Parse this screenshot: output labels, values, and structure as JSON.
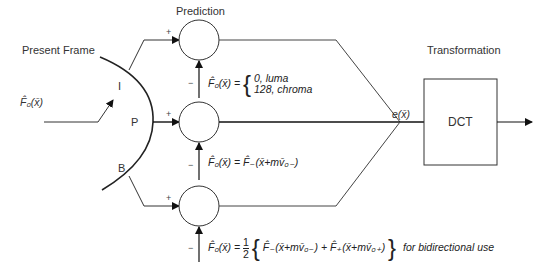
{
  "diagram": {
    "labels": {
      "prediction": "Prediction",
      "present_frame": "Present Frame",
      "transformation": "Transformation",
      "dct": "DCT",
      "switch_i": "I",
      "switch_p": "P",
      "switch_b": "B",
      "error_signal": "e(x̄)",
      "input_signal": "F̂₀(x̄)"
    },
    "signs": {
      "plus": "+",
      "minus": "−"
    },
    "equations": {
      "intra_lhs": "F̂₀(x̄) =",
      "intra_case1": "0, luma",
      "intra_case2": "128, chroma",
      "predicted": "F̂₀(x̄) = F̂₋(x̄+mv̄₀₋)",
      "bidirectional_lhs": "F̂₀(x̄) =",
      "bidirectional_frac_num": "1",
      "bidirectional_frac_den": "2",
      "bidirectional_rhs": "F̂₋(x̄+mv̄₀₋) + F̂₊(x̄+mv̄₀₊)",
      "bidirectional_note": "for bidirectional use"
    }
  }
}
